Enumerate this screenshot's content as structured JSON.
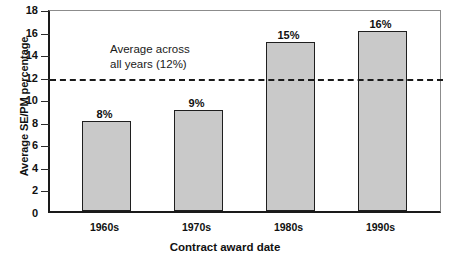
{
  "chart_data": {
    "type": "bar",
    "title": "",
    "xlabel": "Contract award date",
    "ylabel": "Average SE/PM percentage",
    "categories": [
      "1960s",
      "1970s",
      "1980s",
      "1990s"
    ],
    "values": [
      8,
      9,
      15,
      16
    ],
    "value_labels": [
      "8%",
      "9%",
      "15%",
      "16%"
    ],
    "ylim": [
      0,
      18
    ],
    "ytick_values": [
      0,
      2,
      4,
      6,
      8,
      10,
      12,
      14,
      16,
      18
    ],
    "ytick_labels": [
      "0",
      "2",
      "4",
      "6",
      "8",
      "10",
      "12",
      "14",
      "16",
      "18"
    ],
    "grid": false,
    "legend": null,
    "reference_line": {
      "value": 12,
      "style": "dashed",
      "label": "Average across\nall years (12%)"
    },
    "colors": {
      "bar_fill": "#c9c9c9",
      "bar_edge": "#1f1f1f",
      "axis": "#1a1a1a",
      "reference_line": "#1a1a1a",
      "text": "#111111",
      "background": "#ffffff"
    }
  }
}
